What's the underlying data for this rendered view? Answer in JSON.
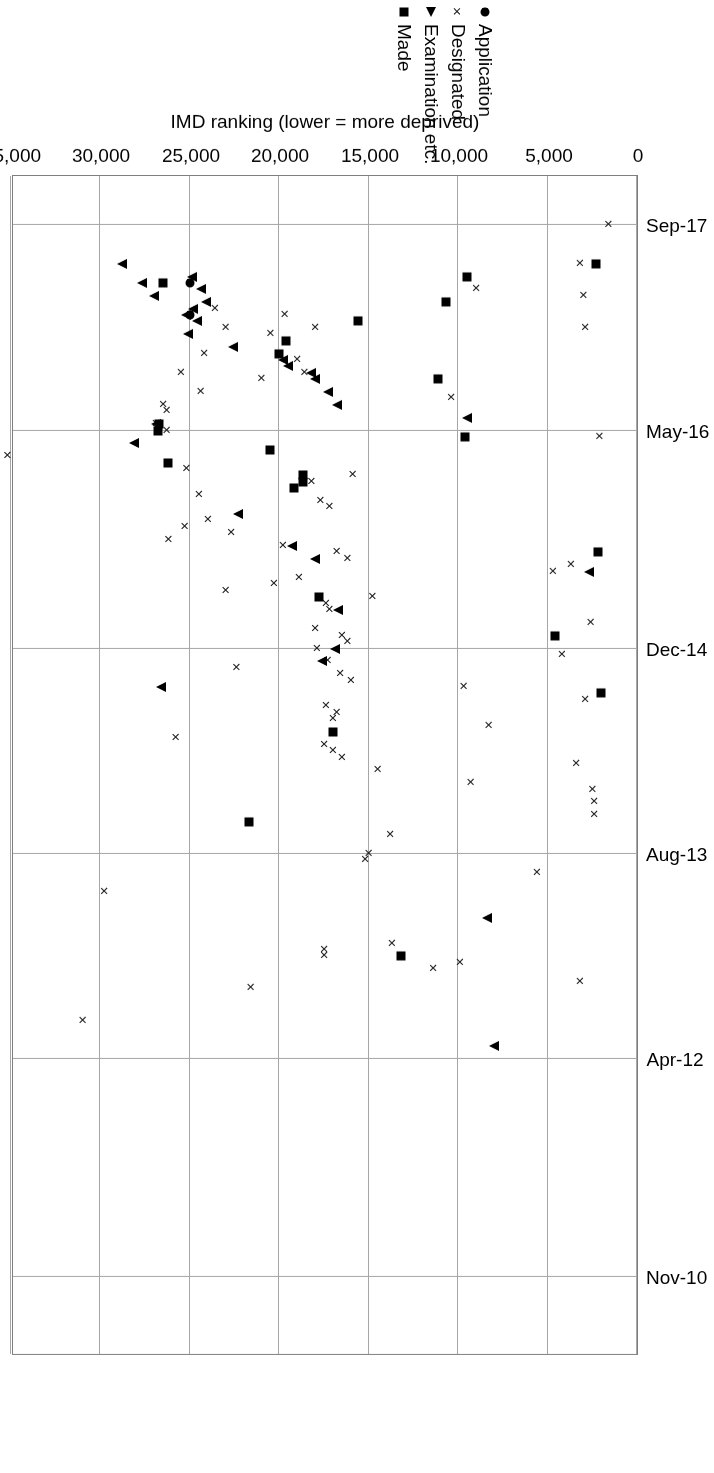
{
  "chart_data": {
    "type": "scatter",
    "title": "",
    "xlabel": "Month and year stage reached",
    "ylabel": "IMD ranking (lower = more deprived)",
    "x_ticklabels": [
      "Nov-10",
      "Apr-12",
      "Aug-13",
      "Dec-14",
      "May-16",
      "Sep-17"
    ],
    "x_tick_months": [
      0,
      17,
      33,
      49,
      66,
      82
    ],
    "xlim_months": [
      -6,
      86
    ],
    "y_ticklabels": [
      "0",
      "5,000",
      "10,000",
      "15,000",
      "20,000",
      "25,000",
      "30,000",
      "35,000"
    ],
    "y_ticks": [
      0,
      5000,
      10000,
      15000,
      20000,
      25000,
      30000,
      35000
    ],
    "ylim": [
      0,
      35000
    ],
    "grid": "both",
    "legend_position": "top-right",
    "legend": [
      {
        "label": "Application",
        "marker": "circle"
      },
      {
        "label": "Designated",
        "marker": "cross"
      },
      {
        "label": "Examination etc.",
        "marker": "triangle"
      },
      {
        "label": "Made",
        "marker": "square"
      }
    ],
    "series": [
      {
        "name": "Application",
        "marker": "circle",
        "points": [
          {
            "x": 77.5,
            "y": 25000
          },
          {
            "x": 75.0,
            "y": 25000
          }
        ]
      },
      {
        "name": "Designated",
        "marker": "cross",
        "points": [
          {
            "x": 82.0,
            "y": 1600
          },
          {
            "x": 79.0,
            "y": 3200
          },
          {
            "x": 76.5,
            "y": 3000
          },
          {
            "x": 74.0,
            "y": 2900
          },
          {
            "x": 77.0,
            "y": 9000
          },
          {
            "x": 74.0,
            "y": 18000
          },
          {
            "x": 75.0,
            "y": 19700
          },
          {
            "x": 73.5,
            "y": 20500
          },
          {
            "x": 75.5,
            "y": 23600
          },
          {
            "x": 74.0,
            "y": 23000
          },
          {
            "x": 71.5,
            "y": 19000
          },
          {
            "x": 72.0,
            "y": 24200
          },
          {
            "x": 70.5,
            "y": 18600
          },
          {
            "x": 70.0,
            "y": 21000
          },
          {
            "x": 70.5,
            "y": 25500
          },
          {
            "x": 69.0,
            "y": 24400
          },
          {
            "x": 68.5,
            "y": 10400
          },
          {
            "x": 68.0,
            "y": 26500
          },
          {
            "x": 67.5,
            "y": 26300
          },
          {
            "x": 66.5,
            "y": 26900
          },
          {
            "x": 66.0,
            "y": 26300
          },
          {
            "x": 65.5,
            "y": 2100
          },
          {
            "x": 64.0,
            "y": 35200
          },
          {
            "x": 63.0,
            "y": 25200
          },
          {
            "x": 62.5,
            "y": 15900
          },
          {
            "x": 62.0,
            "y": 18200
          },
          {
            "x": 61.0,
            "y": 24500
          },
          {
            "x": 60.5,
            "y": 17700
          },
          {
            "x": 60.0,
            "y": 17200
          },
          {
            "x": 59.0,
            "y": 24000
          },
          {
            "x": 58.5,
            "y": 25300
          },
          {
            "x": 58.0,
            "y": 22700
          },
          {
            "x": 57.5,
            "y": 26200
          },
          {
            "x": 57.0,
            "y": 19800
          },
          {
            "x": 56.5,
            "y": 16800
          },
          {
            "x": 56.0,
            "y": 16200
          },
          {
            "x": 55.5,
            "y": 3700
          },
          {
            "x": 55.0,
            "y": 4700
          },
          {
            "x": 54.5,
            "y": 18900
          },
          {
            "x": 54.0,
            "y": 20300
          },
          {
            "x": 53.5,
            "y": 23000
          },
          {
            "x": 53.0,
            "y": 14800
          },
          {
            "x": 52.5,
            "y": 17400
          },
          {
            "x": 52.0,
            "y": 17200
          },
          {
            "x": 51.0,
            "y": 2600
          },
          {
            "x": 50.5,
            "y": 18000
          },
          {
            "x": 50.0,
            "y": 16500
          },
          {
            "x": 49.5,
            "y": 16200
          },
          {
            "x": 49.0,
            "y": 17900
          },
          {
            "x": 48.5,
            "y": 4200
          },
          {
            "x": 48.0,
            "y": 17300
          },
          {
            "x": 47.5,
            "y": 22400
          },
          {
            "x": 47.0,
            "y": 16600
          },
          {
            "x": 46.5,
            "y": 16000
          },
          {
            "x": 46.0,
            "y": 9700
          },
          {
            "x": 45.0,
            "y": 2900
          },
          {
            "x": 44.5,
            "y": 17400
          },
          {
            "x": 44.0,
            "y": 16800
          },
          {
            "x": 43.5,
            "y": 17000
          },
          {
            "x": 43.0,
            "y": 8300
          },
          {
            "x": 42.0,
            "y": 25800
          },
          {
            "x": 41.5,
            "y": 17500
          },
          {
            "x": 41.0,
            "y": 17000
          },
          {
            "x": 40.5,
            "y": 16500
          },
          {
            "x": 40.0,
            "y": 3400
          },
          {
            "x": 39.5,
            "y": 14500
          },
          {
            "x": 38.5,
            "y": 9300
          },
          {
            "x": 38.0,
            "y": 2500
          },
          {
            "x": 37.0,
            "y": 2400
          },
          {
            "x": 36.0,
            "y": 2400
          },
          {
            "x": 34.5,
            "y": 13800
          },
          {
            "x": 33.0,
            "y": 15000
          },
          {
            "x": 32.5,
            "y": 15200
          },
          {
            "x": 31.5,
            "y": 5600
          },
          {
            "x": 30.0,
            "y": 29800
          },
          {
            "x": 26.0,
            "y": 13700
          },
          {
            "x": 25.5,
            "y": 17500
          },
          {
            "x": 25.0,
            "y": 17500
          },
          {
            "x": 24.5,
            "y": 9900
          },
          {
            "x": 24.0,
            "y": 11400
          },
          {
            "x": 23.0,
            "y": 3200
          },
          {
            "x": 22.5,
            "y": 21600
          },
          {
            "x": 20.0,
            "y": 31000
          }
        ]
      },
      {
        "name": "Examination etc.",
        "marker": "triangle",
        "points": [
          {
            "x": 79.0,
            "y": 28800
          },
          {
            "x": 77.5,
            "y": 27700
          },
          {
            "x": 76.5,
            "y": 27000
          },
          {
            "x": 78.0,
            "y": 24900
          },
          {
            "x": 77.0,
            "y": 24400
          },
          {
            "x": 76.0,
            "y": 24100
          },
          {
            "x": 75.5,
            "y": 24800
          },
          {
            "x": 75.0,
            "y": 25200
          },
          {
            "x": 74.5,
            "y": 24600
          },
          {
            "x": 73.5,
            "y": 25100
          },
          {
            "x": 72.5,
            "y": 22600
          },
          {
            "x": 71.5,
            "y": 19800
          },
          {
            "x": 71.0,
            "y": 19500
          },
          {
            "x": 70.5,
            "y": 18200
          },
          {
            "x": 70.0,
            "y": 18000
          },
          {
            "x": 69.0,
            "y": 17300
          },
          {
            "x": 68.0,
            "y": 16800
          },
          {
            "x": 67.0,
            "y": 9500
          },
          {
            "x": 66.5,
            "y": 26900
          },
          {
            "x": 65.0,
            "y": 28100
          },
          {
            "x": 59.5,
            "y": 22300
          },
          {
            "x": 57.0,
            "y": 19300
          },
          {
            "x": 56.0,
            "y": 18000
          },
          {
            "x": 55.0,
            "y": 2700
          },
          {
            "x": 52.0,
            "y": 16700
          },
          {
            "x": 49.0,
            "y": 16900
          },
          {
            "x": 48.0,
            "y": 17600
          },
          {
            "x": 46.0,
            "y": 26600
          },
          {
            "x": 28.0,
            "y": 8400
          },
          {
            "x": 18.0,
            "y": 8000
          }
        ]
      },
      {
        "name": "Made",
        "marker": "square",
        "points": [
          {
            "x": 79.0,
            "y": 2300
          },
          {
            "x": 78.0,
            "y": 9500
          },
          {
            "x": 77.5,
            "y": 26500
          },
          {
            "x": 76.0,
            "y": 10700
          },
          {
            "x": 74.5,
            "y": 15600
          },
          {
            "x": 73.0,
            "y": 19600
          },
          {
            "x": 72.0,
            "y": 20000
          },
          {
            "x": 70.0,
            "y": 11100
          },
          {
            "x": 66.5,
            "y": 26700
          },
          {
            "x": 66.0,
            "y": 26800
          },
          {
            "x": 65.5,
            "y": 9600
          },
          {
            "x": 64.5,
            "y": 20500
          },
          {
            "x": 63.5,
            "y": 26200
          },
          {
            "x": 62.5,
            "y": 18700
          },
          {
            "x": 62.0,
            "y": 18700
          },
          {
            "x": 61.5,
            "y": 19200
          },
          {
            "x": 56.5,
            "y": 2200
          },
          {
            "x": 53.0,
            "y": 17800
          },
          {
            "x": 50.0,
            "y": 4600
          },
          {
            "x": 45.5,
            "y": 2000
          },
          {
            "x": 42.5,
            "y": 17000
          },
          {
            "x": 35.5,
            "y": 21700
          },
          {
            "x": 25.0,
            "y": 13200
          }
        ]
      }
    ]
  }
}
